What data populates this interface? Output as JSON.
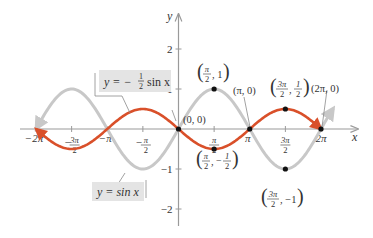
{
  "chart_data": {
    "type": "line",
    "title": "",
    "xlabel": "x",
    "ylabel": "y",
    "xlim": [
      -6.2832,
      6.2832
    ],
    "ylim": [
      -2,
      2
    ],
    "grid": false,
    "x_ticks": [
      {
        "value": -6.2832,
        "label": "−2π"
      },
      {
        "value": -4.7124,
        "label": "−3π/2"
      },
      {
        "value": -3.1416,
        "label": "−π"
      },
      {
        "value": -1.5708,
        "label": "−π/2"
      },
      {
        "value": 1.5708,
        "label": "π/2"
      },
      {
        "value": 3.1416,
        "label": "π"
      },
      {
        "value": 4.7124,
        "label": "3π/2"
      },
      {
        "value": 6.2832,
        "label": "2π"
      }
    ],
    "y_ticks": [
      {
        "value": 2,
        "label": "2"
      },
      {
        "value": 1,
        "label": "1"
      },
      {
        "value": -1,
        "label": "−1"
      },
      {
        "value": -2,
        "label": "−2"
      }
    ],
    "series": [
      {
        "name": "y = sin x",
        "function": "sin(x)",
        "color": "#c8c8c8",
        "x": [
          -6.2832,
          -4.7124,
          -3.1416,
          -1.5708,
          0,
          1.5708,
          3.1416,
          4.7124,
          6.2832
        ],
        "values": [
          0,
          1,
          0,
          -1,
          0,
          1,
          0,
          -1,
          0
        ]
      },
      {
        "name": "y = −(1/2) sin x",
        "function": "-0.5*sin(x)",
        "color": "#d9502a",
        "x": [
          -6.2832,
          -4.7124,
          -3.1416,
          -1.5708,
          0,
          1.5708,
          3.1416,
          4.7124,
          6.2832
        ],
        "values": [
          0,
          -0.5,
          0,
          0.5,
          0,
          -0.5,
          0,
          0.5,
          0
        ]
      }
    ],
    "annotations": [
      {
        "label": "(0, 0)",
        "x": 0,
        "y": 0
      },
      {
        "label": "(π/2, 1)",
        "x": 1.5708,
        "y": 1
      },
      {
        "label": "(π/2, −1/2)",
        "x": 1.5708,
        "y": -0.5
      },
      {
        "label": "(π, 0)",
        "x": 3.1416,
        "y": 0
      },
      {
        "label": "(3π/2, 1/2)",
        "x": 4.7124,
        "y": 0.5
      },
      {
        "label": "(3π/2, −1)",
        "x": 4.7124,
        "y": -1
      },
      {
        "label": "(2π, 0)",
        "x": 6.2832,
        "y": 0
      }
    ],
    "legend": [
      {
        "label": "y = −½ sin x",
        "series": 1
      },
      {
        "label": "y = sin x",
        "series": 0
      }
    ]
  },
  "labels": {
    "x_axis": "x",
    "y_axis": "y",
    "eq_half_prefix": "y = −",
    "eq_half_num": "1",
    "eq_half_den": "2",
    "eq_half_suffix": "sin x",
    "eq_sin": "y = sin x",
    "pt_origin": "(0, 0)",
    "pt_pi0": "(π, 0)",
    "pt_2pi0": "(2π, 0)"
  },
  "colors": {
    "sin": "#c8c8c8",
    "half": "#d9502a",
    "axis": "#9a9a9a",
    "box": "#e4e4e4"
  }
}
